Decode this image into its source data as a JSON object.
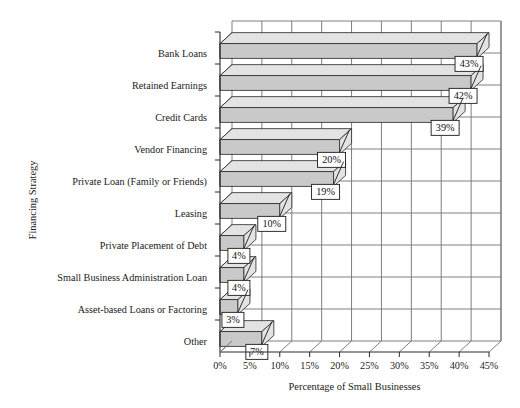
{
  "chart_data": {
    "type": "bar",
    "orientation": "horizontal",
    "title": "",
    "xlabel": "Percentage of Small Businesses",
    "ylabel": "Financing Strategy",
    "xlim": [
      0,
      45
    ],
    "xticks": [
      "0%",
      "5%",
      "10%",
      "15%",
      "20%",
      "25%",
      "30%",
      "35%",
      "40%",
      "45%"
    ],
    "xtick_values": [
      0,
      5,
      10,
      15,
      20,
      25,
      30,
      35,
      40,
      45
    ],
    "grid": true,
    "legend": "none",
    "style": "3d-bar",
    "categories": [
      "Bank Loans",
      "Retained Earnings",
      "Credit Cards",
      "Vendor Financing",
      "Private Loan (Family or Friends)",
      "Leasing",
      "Private Placement of Debt",
      "Small Business Administration Loan",
      "Asset-based Loans or Factoring",
      "Other"
    ],
    "values": [
      43,
      42,
      39,
      20,
      19,
      10,
      4,
      4,
      3,
      7
    ],
    "data_labels": [
      "43%",
      "42%",
      "39%",
      "20%",
      "19%",
      "10%",
      "4%",
      "4%",
      "3%",
      "7%"
    ],
    "colors": {
      "bar_front": "#c9c9c9",
      "bar_top": "#e3e3e3",
      "bar_side": "#111111",
      "gridline": "#6f6f6f",
      "axis": "#2a2a2a",
      "text": "#1a1a1a",
      "background": "#ffffff",
      "callout_fill": "#ffffff"
    }
  }
}
